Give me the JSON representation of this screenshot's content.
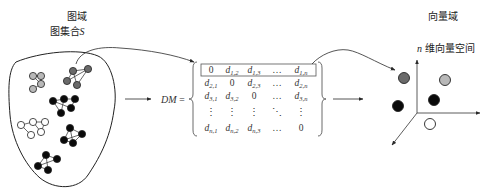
{
  "left": {
    "title": "图域",
    "subtitle_prefix": "图集合",
    "subtitle_var": "S",
    "graphs": [
      {
        "id": "g1",
        "fill": "light-gray"
      },
      {
        "id": "g2",
        "fill": "dark-gray"
      },
      {
        "id": "g3",
        "fill": "black"
      },
      {
        "id": "g4",
        "fill": "white"
      },
      {
        "id": "g5",
        "fill": "black"
      },
      {
        "id": "g6",
        "fill": "black"
      }
    ]
  },
  "middle": {
    "label": "DM",
    "equals": "=",
    "matrix": [
      [
        {
          "t": "0"
        },
        {
          "t": "d",
          "s": "1,2"
        },
        {
          "t": "d",
          "s": "1,3"
        },
        {
          "t": "…"
        },
        {
          "t": "d",
          "s": "1,n"
        }
      ],
      [
        {
          "t": "d",
          "s": "2,1"
        },
        {
          "t": "0"
        },
        {
          "t": "d",
          "s": "2,3"
        },
        {
          "t": "…"
        },
        {
          "t": "d",
          "s": "2,n"
        }
      ],
      [
        {
          "t": "d",
          "s": "3,1"
        },
        {
          "t": "d",
          "s": "3,2"
        },
        {
          "t": "0"
        },
        {
          "t": "…"
        },
        {
          "t": "d",
          "s": "3,n"
        }
      ],
      [
        {
          "t": "⋮"
        },
        {
          "t": "⋮"
        },
        {
          "t": "⋮"
        },
        {
          "t": "⋱"
        },
        {
          "t": "⋮"
        }
      ],
      [
        {
          "t": "d",
          "s": "n,1"
        },
        {
          "t": "d",
          "s": "n,2"
        },
        {
          "t": "d",
          "s": "n,3"
        },
        {
          "t": "…"
        },
        {
          "t": "0"
        }
      ]
    ]
  },
  "right": {
    "title": "向量域",
    "subtitle_var": "n",
    "subtitle_suffix": " 维向量空间",
    "points": [
      {
        "fill": "dark-gray"
      },
      {
        "fill": "light-gray"
      },
      {
        "fill": "black"
      },
      {
        "fill": "black"
      },
      {
        "fill": "white"
      }
    ]
  },
  "colors": {
    "light-gray": "#b8b8b8",
    "dark-gray": "#6a6a6a",
    "black": "#0a0a0a",
    "white": "#ffffff",
    "line": "#2a2a2a"
  }
}
